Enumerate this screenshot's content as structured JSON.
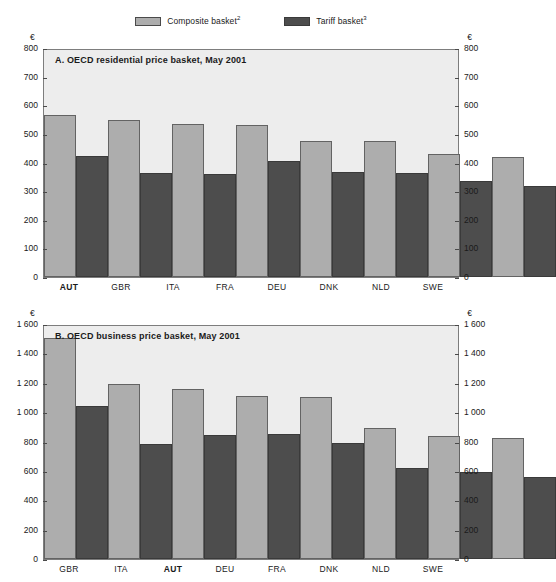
{
  "legend": {
    "entries": [
      {
        "label": "Composite basket",
        "superscript": "2",
        "color": "#adadad",
        "icon": "legend-swatch-light"
      },
      {
        "label": "Tariff basket",
        "superscript": "3",
        "color": "#4d4d4d",
        "icon": "legend-swatch-dark"
      }
    ]
  },
  "panel_a": {
    "unit_left": "€",
    "unit_right": "€",
    "title": "A.  OECD residential price basket, May 2001",
    "yticks": [
      "0",
      "100",
      "200",
      "300",
      "400",
      "500",
      "600",
      "700",
      "800"
    ],
    "categories": [
      "AUT",
      "GBR",
      "ITA",
      "FRA",
      "DEU",
      "DNK",
      "NLD",
      "SWE"
    ],
    "highlight": "AUT"
  },
  "panel_b": {
    "unit_left": "€",
    "unit_right": "€",
    "title": "B.  OECD business price basket, May 2001",
    "yticks": [
      "0",
      "200",
      "400",
      "600",
      "800",
      "1 000",
      "1 200",
      "1 400",
      "1 600"
    ],
    "categories": [
      "GBR",
      "ITA",
      "AUT",
      "DEU",
      "FRA",
      "DNK",
      "NLD",
      "SWE"
    ],
    "highlight": "AUT"
  },
  "chart_data": [
    {
      "type": "bar",
      "id": "panel-a",
      "title": "A.  OECD residential price basket, May 2001",
      "xlabel": "",
      "ylabel": "€",
      "ylim": [
        0,
        800
      ],
      "ytick_step": 100,
      "grid": false,
      "legend_position": "top-center",
      "categories": [
        "AUT",
        "GBR",
        "ITA",
        "FRA",
        "DEU",
        "DNK",
        "NLD",
        "SWE"
      ],
      "series": [
        {
          "name": "Composite basket",
          "color": "#adadad",
          "values": [
            570,
            555,
            540,
            535,
            480,
            478,
            432,
            423
          ]
        },
        {
          "name": "Tariff basket",
          "color": "#4d4d4d",
          "values": [
            428,
            367,
            362,
            408,
            370,
            365,
            340,
            322
          ]
        }
      ]
    },
    {
      "type": "bar",
      "id": "panel-b",
      "title": "B.  OECD business price basket, May 2001",
      "xlabel": "",
      "ylabel": "€",
      "ylim": [
        0,
        1600
      ],
      "ytick_step": 200,
      "grid": false,
      "legend_position": "top-center",
      "categories": [
        "GBR",
        "ITA",
        "AUT",
        "DEU",
        "FRA",
        "DNK",
        "NLD",
        "SWE"
      ],
      "series": [
        {
          "name": "Composite basket",
          "color": "#adadad",
          "values": [
            1520,
            1205,
            1168,
            1120,
            1110,
            898,
            845,
            832
          ]
        },
        {
          "name": "Tariff basket",
          "color": "#4d4d4d",
          "values": [
            1048,
            793,
            850,
            858,
            800,
            628,
            598,
            565
          ]
        }
      ]
    }
  ]
}
